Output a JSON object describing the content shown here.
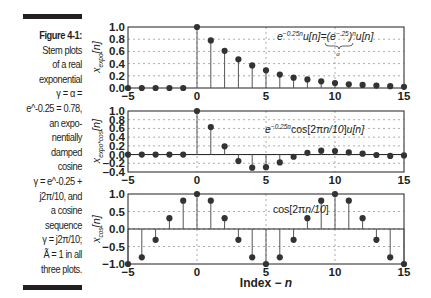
{
  "caption": {
    "title": "Figure 4-1:",
    "lines": [
      "Stem plots",
      "of a real",
      "exponential",
      "γ = α =",
      "e^-0.25 = 0.78,",
      "an expo-",
      "nentially",
      "damped",
      "cosine",
      "γ = e^-0.25 +",
      "j2π/10, and",
      "a cosine",
      "sequence",
      "γ = j2π/10;",
      "Ã = 1 in all",
      "three plots."
    ]
  },
  "chart_data": [
    {
      "type": "stem",
      "title": "",
      "ylabel": "x_expo[n]",
      "xlabel": "",
      "annotation": "e^{-0.25n}u[n] = (e^{-.25})^n u[n]  (underbrace: α)",
      "xlim": [
        -5,
        15
      ],
      "ylim": [
        0,
        1.0
      ],
      "xticks": [
        -5,
        0,
        5,
        10,
        15
      ],
      "yticks": [
        0.0,
        0.2,
        0.4,
        0.6,
        0.8,
        1.0
      ],
      "ytick_labels": [
        "0.0",
        "0.2",
        "0.4",
        "0.6",
        "0.8",
        "1.0"
      ],
      "grid": true,
      "x": [
        -5,
        -4,
        -3,
        -2,
        -1,
        0,
        1,
        2,
        3,
        4,
        5,
        6,
        7,
        8,
        9,
        10,
        11,
        12,
        13,
        14,
        15
      ],
      "values": [
        0,
        0,
        0,
        0,
        0,
        1.0,
        0.78,
        0.61,
        0.47,
        0.37,
        0.29,
        0.22,
        0.17,
        0.14,
        0.11,
        0.08,
        0.06,
        0.05,
        0.04,
        0.03,
        0.02
      ]
    },
    {
      "type": "stem",
      "title": "",
      "ylabel": "x_expo*cos[n]",
      "xlabel": "",
      "annotation": "e^{-0.25n}cos[2πn/10]u[n]",
      "xlim": [
        -5,
        15
      ],
      "ylim": [
        -0.4,
        1.0
      ],
      "xticks": [
        -5,
        0,
        5,
        10,
        15
      ],
      "yticks": [
        -0.4,
        -0.2,
        0.0,
        0.2,
        0.4,
        0.6,
        0.8,
        1.0
      ],
      "ytick_labels": [
        "-0.4",
        "-0.2",
        "0.0",
        "0.2",
        "0.4",
        "0.6",
        "0.8",
        "1.0"
      ],
      "grid": true,
      "x": [
        -5,
        -4,
        -3,
        -2,
        -1,
        0,
        1,
        2,
        3,
        4,
        5,
        6,
        7,
        8,
        9,
        10,
        11,
        12,
        13,
        14,
        15
      ],
      "values": [
        0,
        0,
        0,
        0,
        0,
        1.0,
        0.63,
        0.19,
        -0.15,
        -0.3,
        -0.29,
        -0.18,
        -0.05,
        0.04,
        0.09,
        0.08,
        0.05,
        0.02,
        -0.01,
        -0.03,
        -0.02
      ]
    },
    {
      "type": "stem",
      "title": "",
      "ylabel": "x_cos[n]",
      "xlabel": "Index − n",
      "annotation": "cos[2πn/10]",
      "xlim": [
        -5,
        15
      ],
      "ylim": [
        -1.0,
        1.0
      ],
      "xticks": [
        -5,
        0,
        5,
        10,
        15
      ],
      "yticks": [
        -1.0,
        -0.5,
        0.0,
        0.5,
        1.0
      ],
      "ytick_labels": [
        "-1.0",
        "-0.5",
        "0.0",
        "0.5",
        "1.0"
      ],
      "grid": true,
      "x": [
        -5,
        -4,
        -3,
        -2,
        -1,
        0,
        1,
        2,
        3,
        4,
        5,
        6,
        7,
        8,
        9,
        10,
        11,
        12,
        13,
        14,
        15
      ],
      "values": [
        -1.0,
        -0.81,
        -0.31,
        0.31,
        0.81,
        1.0,
        0.81,
        0.31,
        -0.31,
        -0.81,
        -1.0,
        -0.81,
        -0.31,
        0.31,
        0.81,
        1.0,
        0.81,
        0.31,
        -0.31,
        -0.81,
        -1.0
      ]
    }
  ],
  "colors": {
    "ink": "#231f20",
    "grid": "#8a8a8a",
    "stem": "#555555"
  }
}
